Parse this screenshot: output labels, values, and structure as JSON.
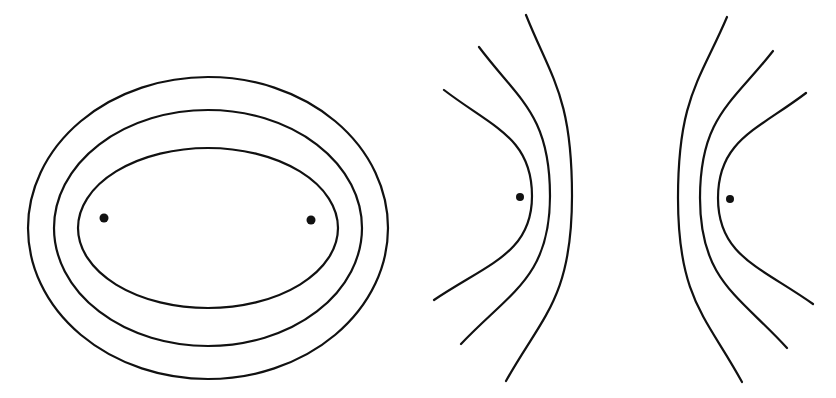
{
  "figure": {
    "background": "#ffffff",
    "stroke_color": "#111111",
    "panels": [
      {
        "name": "confocal-ellipses",
        "center": [
          208,
          228
        ],
        "ellipses": [
          {
            "name": "outer",
            "rx": 180,
            "ry": 151
          },
          {
            "name": "middle",
            "rx": 154,
            "ry": 118
          },
          {
            "name": "inner",
            "rx": 130,
            "ry": 80
          }
        ],
        "foci": [
          [
            104,
            218
          ],
          [
            311,
            220
          ]
        ]
      },
      {
        "name": "confocal-hyperbolas",
        "foci": [
          [
            520,
            197
          ],
          [
            730,
            199
          ]
        ],
        "left_branches": [
          {
            "name": "inner",
            "vertex": [
              532,
              196
            ],
            "top": [
              444,
              90
            ],
            "bottom": [
              434,
              300
            ]
          },
          {
            "name": "middle",
            "vertex": [
              550,
              196
            ],
            "top": [
              479,
              47
            ],
            "bottom": [
              461,
              344
            ]
          },
          {
            "name": "outer",
            "vertex": [
              572,
              196
            ],
            "top": [
              526,
              15
            ],
            "bottom": [
              506,
              381
            ]
          }
        ],
        "right_branches": [
          {
            "name": "outer",
            "vertex": [
              678,
              198
            ],
            "top": [
              727,
              17
            ],
            "bottom": [
              742,
              382
            ]
          },
          {
            "name": "middle",
            "vertex": [
              700,
              198
            ],
            "top": [
              773,
              51
            ],
            "bottom": [
              787,
              348
            ]
          },
          {
            "name": "inner",
            "vertex": [
              718,
              198
            ],
            "top": [
              806,
              93
            ],
            "bottom": [
              813,
              304
            ]
          }
        ]
      }
    ]
  }
}
